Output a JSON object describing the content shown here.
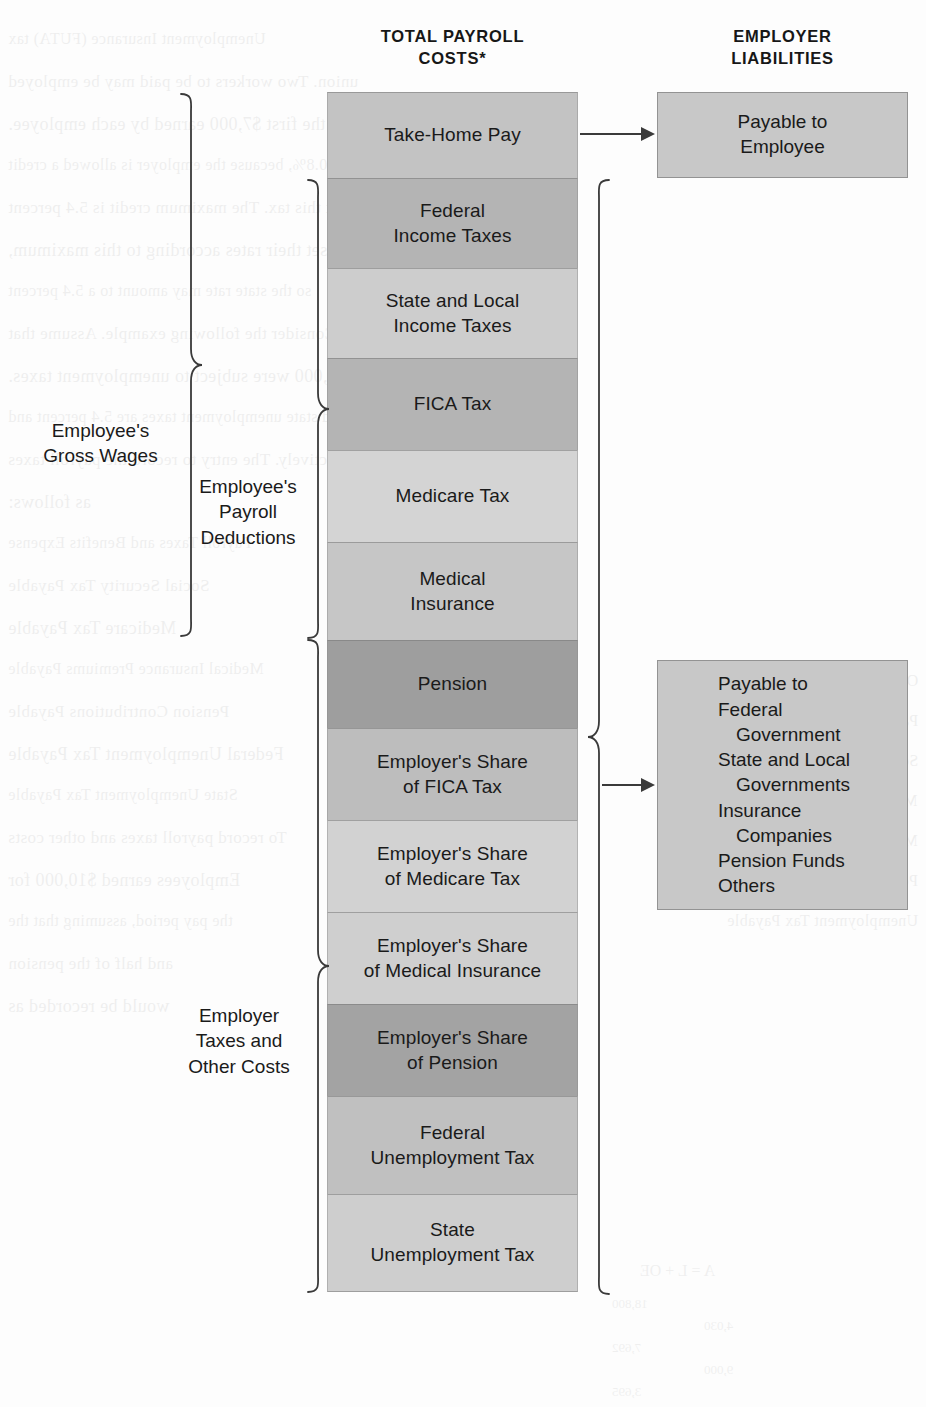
{
  "headers": {
    "total_payroll_costs": "TOTAL PAYROLL\nCOSTS*",
    "employer_liabilities": "EMPLOYER\nLIABILITIES"
  },
  "stack": {
    "segments": [
      {
        "label": "Take-Home Pay",
        "color": "#c3c3c3",
        "height": 86,
        "group": "take_home"
      },
      {
        "label": "Federal\nIncome Taxes",
        "color": "#b4b4b4",
        "height": 90,
        "group": "employee_deductions"
      },
      {
        "label": "State and Local\nIncome Taxes",
        "color": "#cdcdcd",
        "height": 90,
        "group": "employee_deductions"
      },
      {
        "label": "FICA Tax",
        "color": "#b4b4b4",
        "height": 92,
        "group": "employee_deductions"
      },
      {
        "label": "Medicare Tax",
        "color": "#d4d4d4",
        "height": 92,
        "group": "employee_deductions"
      },
      {
        "label": "Medical\nInsurance",
        "color": "#c6c6c6",
        "height": 98,
        "group": "employee_deductions"
      },
      {
        "label": "Pension",
        "color": "#9e9e9e",
        "height": 88,
        "group": "employee_deductions"
      },
      {
        "label": "Employer's Share\nof FICA Tax",
        "color": "#bdbdbd",
        "height": 92,
        "group": "employer_costs"
      },
      {
        "label": "Employer's Share\nof Medicare Tax",
        "color": "#d2d2d2",
        "height": 92,
        "group": "employer_costs"
      },
      {
        "label": "Employer's Share\nof Medical Insurance",
        "color": "#cfcfcf",
        "height": 92,
        "group": "employer_costs"
      },
      {
        "label": "Employer's Share\nof Pension",
        "color": "#a3a3a3",
        "height": 92,
        "group": "employer_costs"
      },
      {
        "label": "Federal\nUnemployment Tax",
        "color": "#c0c0c0",
        "height": 98,
        "group": "employer_costs"
      },
      {
        "label": "State\nUnemployment Tax",
        "color": "#cecece",
        "height": 98,
        "group": "employer_costs"
      }
    ]
  },
  "side_labels": {
    "gross_wages": "Employee's\nGross Wages",
    "payroll_deductions": "Employee's\nPayroll\nDeductions",
    "employer_taxes": "Employer\nTaxes and\nOther Costs"
  },
  "right_boxes": {
    "payable_employee": {
      "color": "#c8c8c8",
      "lines": [
        "Payable to",
        "Employee"
      ]
    },
    "payable_liabilities": {
      "color": "#c8c8c8",
      "lines": [
        {
          "text": "Payable to",
          "indent": false
        },
        {
          "text": "Federal",
          "indent": false
        },
        {
          "text": "Government",
          "indent": true
        },
        {
          "text": "State and Local",
          "indent": false
        },
        {
          "text": "Governments",
          "indent": true
        },
        {
          "text": "Insurance",
          "indent": false
        },
        {
          "text": "Companies",
          "indent": true
        },
        {
          "text": "Pension Funds",
          "indent": false
        },
        {
          "text": "Others",
          "indent": false
        }
      ]
    }
  },
  "arrows": {
    "take_home_to_employee": "arrow-right",
    "deductions_to_liabilities": "arrow-right"
  },
  "bleed_through": {
    "left": [
      "Unemployment Insurance (FUTA) tax",
      "union. Two workers to be paid may be employed",
      "the first $7,000 earned by each employee.",
      "0.8%, because the employer is allowed a credit",
      "against this tax. The maximum credit is 5.4 percent",
      "Most states set their rates according to this maximum,",
      "so the state rate may amount to a 5.4 percent",
      "Consider the following example. Assume that",
      "payroll of $10,000 were subject to unemployment taxes.",
      "and state unemployment taxes are 5.4 percent and",
      "respectively. The entry to record the payroll taxes",
      "as follows:",
      "Payroll Taxes and Benefits Expense",
      "Social Security Tax Payable",
      "Medicare Tax Payable",
      "Medical Insurance Premiums Payable",
      "Pension Contributions Payable",
      "Federal Unemployment Tax Payable",
      "State Unemployment Tax Payable",
      "To record payroll taxes and other costs",
      "Employees earned $10,000 for",
      "the pay period, assuming that the",
      "and half of the pension",
      "would be recorded as"
    ],
    "right": [
      "OE",
      "Payroll Taxes and Benefits Expense",
      "Social Security Tax Payable",
      "Medicare Tax Payable",
      "Medical Insurance Premiums Payable",
      "Pension Contributions Payable",
      "Unemployment Tax Payable"
    ],
    "numbers": [
      "18,800",
      "4,030",
      "7,692",
      "9,000",
      "3,695"
    ],
    "math_row": "A    =    L    +    OE"
  }
}
